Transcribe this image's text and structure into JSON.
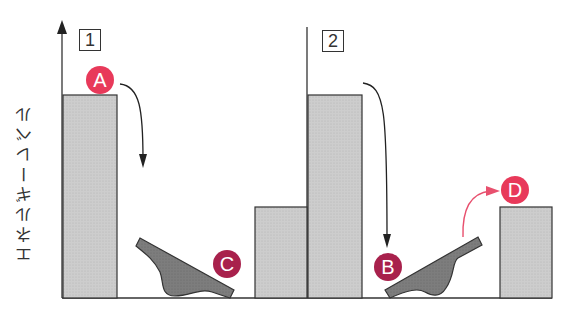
{
  "diagram": {
    "y_axis_label": "エネルギーレベル",
    "panels": [
      {
        "id": "1",
        "label": "1"
      },
      {
        "id": "2",
        "label": "2"
      }
    ],
    "markers": [
      {
        "id": "A",
        "label": "A",
        "color": "#e8395a"
      },
      {
        "id": "B",
        "label": "B",
        "color": "#a8214c"
      },
      {
        "id": "C",
        "label": "C",
        "color": "#a8214c"
      },
      {
        "id": "D",
        "label": "D",
        "color": "#e8395a"
      }
    ],
    "colors": {
      "bar_fill": "#c8c8c8",
      "lever_fill": "#7a7a7a",
      "stroke": "#333333",
      "arrow_black": "#222222",
      "arrow_pink": "#e8506e"
    }
  }
}
